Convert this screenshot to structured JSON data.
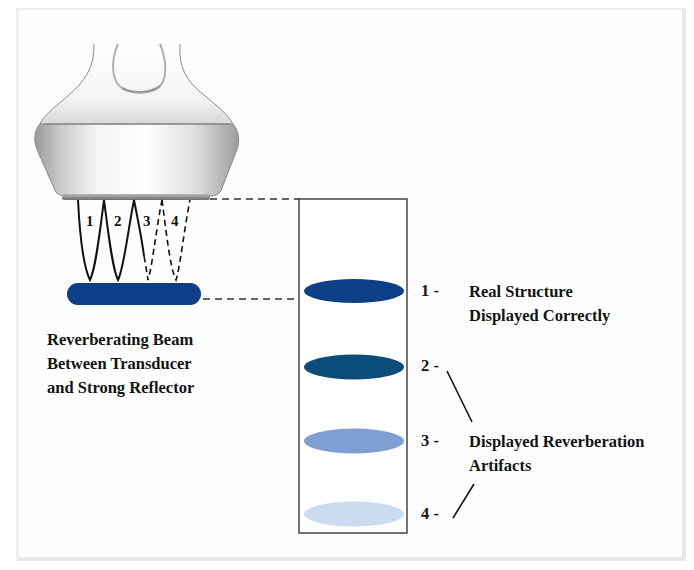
{
  "diagram": {
    "title": "Reverberation Artifact",
    "caption_lines": [
      "Reverberating Beam",
      "Between Transducer",
      "and Strong Reflector"
    ],
    "beam_labels": [
      "1",
      "2",
      "3",
      "4"
    ],
    "display_items": [
      {
        "number": "1 -",
        "color": "#0d3f86",
        "kind": "real"
      },
      {
        "number": "2 -",
        "color": "#0b4d78",
        "kind": "artifact"
      },
      {
        "number": "3 -",
        "color": "#7f9fd3",
        "kind": "artifact"
      },
      {
        "number": "4 -",
        "color": "#c9dcf1",
        "kind": "artifact"
      }
    ],
    "label_real": [
      "Real Structure",
      "Displayed Correctly"
    ],
    "label_artifacts": [
      "Displayed Reverberation",
      "Artifacts"
    ],
    "colors": {
      "reflector": "#0d3f86",
      "frame_border": "#e8ebee",
      "line": "#1a1a1a"
    },
    "components": [
      "transducer",
      "strong-reflector",
      "display-box"
    ]
  }
}
